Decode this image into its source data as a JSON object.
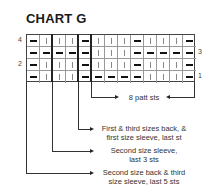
{
  "title": "CHART G",
  "row_numbers": {
    "r4": "4",
    "r3": "3",
    "r2": "2",
    "r1": "1"
  },
  "chart": {
    "columns": 13,
    "rows": [
      {
        "row": 4,
        "cells": [
          "P",
          "K",
          "K",
          "K",
          "P",
          "K",
          "K",
          "K",
          "P",
          "K",
          "K",
          "K",
          "P"
        ]
      },
      {
        "row": 3,
        "cells": [
          "P",
          "P",
          "P",
          "P",
          "P",
          "K",
          "K",
          "K",
          "P",
          "P",
          "P",
          "P",
          "P"
        ]
      },
      {
        "row": 2,
        "cells": [
          "P",
          "K",
          "K",
          "K",
          "P",
          "K",
          "K",
          "K",
          "P",
          "K",
          "K",
          "K",
          "P"
        ]
      },
      {
        "row": 1,
        "cells": [
          "P",
          "K",
          "K",
          "K",
          "P",
          "P",
          "P",
          "P",
          "P",
          "K",
          "K",
          "K",
          "P"
        ]
      }
    ],
    "symbol_legend": {
      "P": "dash (purl)",
      "K": "vertical bar (knit)"
    }
  },
  "annotations": {
    "repeat": "8 patt sts",
    "last_st_1": "First & third sizes back, &",
    "last_st_2": "first size sleeve, last st",
    "last3_1": "Second size sleeve,",
    "last3_2": "last 3 sts",
    "last5_1": "Second size back & third",
    "last5_2": "size sleeve, last 5 sts"
  }
}
